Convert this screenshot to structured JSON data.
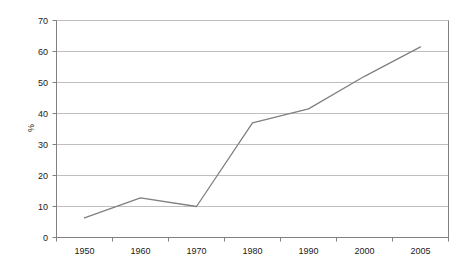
{
  "chart_data": {
    "type": "line",
    "title": "",
    "xlabel": "",
    "ylabel": "%",
    "categories": [
      "1950",
      "1960",
      "1970",
      "1980",
      "1990",
      "2000",
      "2005"
    ],
    "x": [
      1950,
      1960,
      1970,
      1980,
      1990,
      2000,
      2005
    ],
    "values": [
      6.3,
      12.8,
      10.0,
      37.0,
      41.5,
      52.0,
      61.5
    ],
    "series": [
      {
        "name": "",
        "values": [
          6.3,
          12.8,
          10.0,
          37.0,
          41.5,
          52.0,
          61.5
        ]
      }
    ],
    "ylim": [
      0,
      70
    ],
    "y_ticks": [
      0,
      10,
      20,
      30,
      40,
      50,
      60,
      70
    ],
    "y_tick_labels": [
      "0",
      "10",
      "20",
      "30",
      "40",
      "50",
      "60",
      "70"
    ],
    "x_tick_labels": [
      "1950",
      "1960",
      "1970",
      "1980",
      "1990",
      "2000",
      "2005"
    ],
    "grid": {
      "horizontal": true,
      "vertical": false
    },
    "legend": {
      "visible": false,
      "position": "none"
    },
    "colors": {
      "line": "#808080",
      "grid": "#bfbfbf",
      "axis": "#808080",
      "background": "#ffffff",
      "text": "#1a1a1a"
    }
  },
  "axes": {
    "y_title": "%"
  }
}
